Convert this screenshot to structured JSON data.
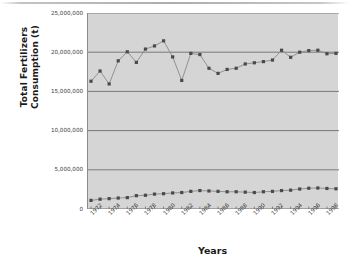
{
  "chart_data": {
    "type": "line",
    "title": "",
    "xlabel": "Years",
    "ylabel": "Total Fertilizers Consumption (t)",
    "grid": true,
    "legend": "none",
    "ylim": [
      0,
      25000000
    ],
    "ytick_labels": [
      "0",
      "5,000,000",
      "10,000,000",
      "15,000,000",
      "20,000,000",
      "25,000,000"
    ],
    "ytick_values": [
      0,
      5000000,
      10000000,
      15000000,
      20000000,
      25000000
    ],
    "x": [
      1972,
      1973,
      1974,
      1975,
      1976,
      1977,
      1978,
      1979,
      1980,
      1981,
      1982,
      1983,
      1984,
      1985,
      1986,
      1987,
      1988,
      1989,
      1990,
      1991,
      1992,
      1993,
      1994,
      1995,
      1996,
      1997,
      1998,
      1999
    ],
    "xtick_labels": [
      "1972",
      "1974",
      "1976",
      "1978",
      "1980",
      "1982",
      "1984",
      "1986",
      "1988",
      "1990",
      "1992",
      "1994",
      "1996",
      "1998"
    ],
    "xtick_values": [
      1972,
      1974,
      1976,
      1978,
      1980,
      1982,
      1984,
      1986,
      1988,
      1990,
      1992,
      1994,
      1996,
      1998
    ],
    "marker": "square",
    "marker_color": "#4a4a4a",
    "line_color": "#8a8a8a",
    "plot_background": "#d5d5d5",
    "series": [
      {
        "name": "Upper series",
        "values": [
          16300000,
          17600000,
          15950000,
          18900000,
          20050000,
          18700000,
          20400000,
          20800000,
          21450000,
          19400000,
          16400000,
          19850000,
          19700000,
          17950000,
          17300000,
          17800000,
          17950000,
          18500000,
          18650000,
          18800000,
          19000000,
          20250000,
          19350000,
          20000000,
          20200000,
          20250000,
          19800000,
          19850000
        ]
      },
      {
        "name": "Lower series",
        "values": [
          1100000,
          1250000,
          1320000,
          1400000,
          1450000,
          1700000,
          1750000,
          1900000,
          1950000,
          2050000,
          2100000,
          2250000,
          2350000,
          2300000,
          2250000,
          2200000,
          2200000,
          2150000,
          2100000,
          2200000,
          2250000,
          2350000,
          2400000,
          2550000,
          2650000,
          2680000,
          2620000,
          2580000
        ]
      }
    ]
  }
}
